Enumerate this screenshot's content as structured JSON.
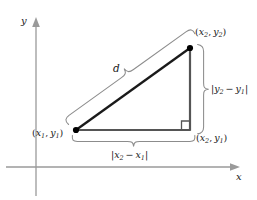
{
  "figure": {
    "background_color": "#ffffff",
    "axis_color": "#9a9a9a",
    "triangle_color": "#1a1a1a",
    "brace_color": "#8c8c8c",
    "point_color": "#000000"
  },
  "axes": {
    "x_label": "x",
    "y_label": "y",
    "origin": {
      "x": 36,
      "y": 167
    }
  },
  "points": [
    {
      "name": "lower-left",
      "label_x": "x",
      "label_x_sub": "1",
      "label_y": "y",
      "label_y_sub": "1",
      "text": "(x1, y1)",
      "px": 76,
      "py": 130
    },
    {
      "name": "upper-right",
      "label_x": "x",
      "label_x_sub": "2",
      "label_y": "y",
      "label_y_sub": "2",
      "text": "(x2, y2)",
      "px": 190,
      "py": 48
    },
    {
      "name": "lower-right",
      "label_x": "x",
      "label_x_sub": "2",
      "label_y": "y",
      "label_y_sub": "1",
      "text": "(x2, y1)",
      "px": 190,
      "py": 130
    }
  ],
  "labels": {
    "hypotenuse": "d",
    "horizontal_leg": "|x2 - x1|",
    "vertical_leg": "|y2 - y1|",
    "open_paren": "(",
    "close_paren": ")",
    "comma": ",",
    "bar": "|",
    "minus": "−",
    "x": "x",
    "y": "y",
    "one": "1",
    "two": "2"
  },
  "markers": {
    "right_angle": "right-angle-square"
  }
}
